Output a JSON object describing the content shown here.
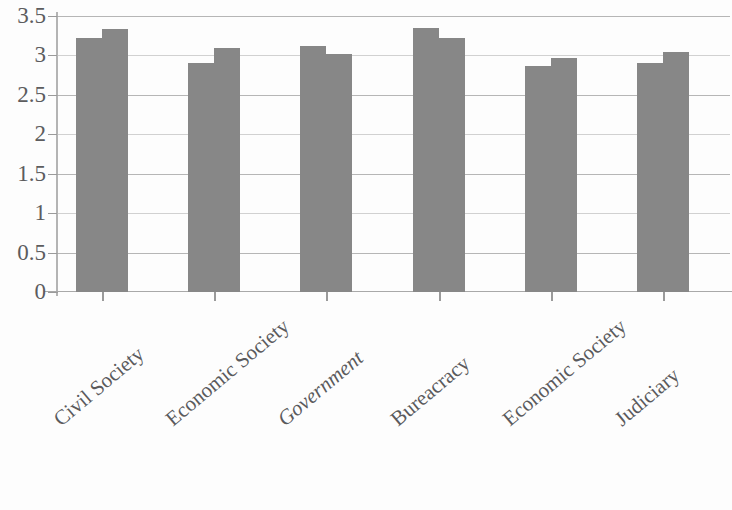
{
  "chart_data": {
    "type": "bar",
    "title": "",
    "subtitle": "",
    "xlabel": "",
    "ylabel": "",
    "ylim": [
      0,
      3.5
    ],
    "grid": true,
    "legend": "none",
    "y_ticks": [
      "3.5",
      "3",
      "2.5",
      "2",
      "1.5",
      "1",
      "0.5",
      "0"
    ],
    "y_tick_values": [
      3.5,
      3,
      2.5,
      2,
      1.5,
      1,
      0.5,
      0
    ],
    "categories": [
      "Civil Society",
      "Economic Society",
      "Government",
      "Bureacracy",
      "Economic Society",
      "Judiciary"
    ],
    "category_styles": [
      "normal",
      "normal",
      "italic",
      "normal",
      "normal",
      "normal"
    ],
    "series": [
      {
        "name": "Series 1",
        "values": [
          3.22,
          2.9,
          3.12,
          3.35,
          2.87,
          2.9
        ]
      },
      {
        "name": "Series 2",
        "values": [
          3.33,
          3.1,
          3.02,
          3.22,
          2.97,
          3.05
        ]
      }
    ],
    "bar_color": "#878787",
    "gridline_color": "#a9a9a9",
    "axis_color": "#b4b4b4",
    "background_color": "#fdfdfd"
  }
}
